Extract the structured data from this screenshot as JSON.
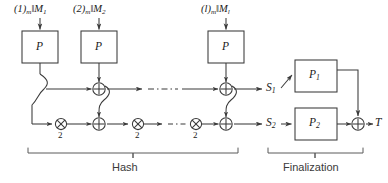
{
  "figure": {
    "type": "block-diagram",
    "title_visible": false,
    "stroke_color": "#3a3a3a",
    "text_color": "#1a1a1a",
    "background": "#ffffff"
  },
  "hash_stage": {
    "section_label": "Hash",
    "message_inputs": [
      {
        "prefix": "(1)",
        "prefix_sub": "m",
        "sep": "‖",
        "block": "M",
        "block_sub": "1"
      },
      {
        "prefix": "(2)",
        "prefix_sub": "m",
        "sep": "‖",
        "block": "M",
        "block_sub": "2"
      },
      {
        "prefix": "(l)",
        "prefix_sub": "m",
        "sep": "‖",
        "block": "M",
        "block_sub": "l"
      }
    ],
    "permutation_boxes": [
      {
        "label": "P"
      },
      {
        "label": "P"
      },
      {
        "label": "P"
      }
    ],
    "top_line_operators": [
      "xor",
      "xor"
    ],
    "bottom_line_operators": [
      "mul",
      "xor",
      "mul",
      "mul",
      "xor"
    ],
    "doubling_labels": [
      "2",
      "2",
      "2"
    ],
    "ellipsis_style": "dash-dot",
    "outputs": [
      {
        "label": "S",
        "sub": "1"
      },
      {
        "label": "S",
        "sub": "2"
      }
    ]
  },
  "finalization_stage": {
    "section_label": "Finalization",
    "permutation_boxes": [
      {
        "label": "P",
        "sub": "1"
      },
      {
        "label": "P",
        "sub": "2"
      }
    ],
    "final_operator": "xor",
    "output": {
      "label": "T"
    }
  },
  "glyphs": {
    "xor": "⊕",
    "mul": "⊗",
    "parallel": "‖"
  }
}
